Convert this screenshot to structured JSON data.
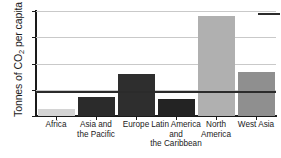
{
  "chart_data": {
    "type": "bar",
    "title": "",
    "xlabel": "",
    "ylabel": "Tonnes of CO2 per capita",
    "ylabel_parts": {
      "prefix": "Tonnes of CO",
      "subscript": "2",
      "suffix": " per capita"
    },
    "ylim": [
      0,
      20
    ],
    "yticks": [
      0,
      5,
      10,
      15,
      20
    ],
    "ytick_labels": [
      "0",
      "5",
      "10",
      "15",
      "20"
    ],
    "grid": true,
    "grid_axis": "y",
    "legend_position": "top-right",
    "categories": [
      "Africa",
      "Asia and the Pacific",
      "Europe",
      "Latin America and the Caribbean",
      "North America",
      "West Asia"
    ],
    "category_label_lines": [
      [
        "Africa"
      ],
      [
        "Asia and",
        "the Pacific"
      ],
      [
        "Europe"
      ],
      [
        "Latin America",
        "and",
        "the Caribbean"
      ],
      [
        "North",
        "America"
      ],
      [
        "West Asia"
      ]
    ],
    "values": [
      1.3,
      3.6,
      8.0,
      3.2,
      19.0,
      8.3
    ],
    "bar_colors": [
      "#d4d4d4",
      "#2b2b2b",
      "#2e2e2e",
      "#232323",
      "#b0b0b0",
      "#8f8f8f"
    ],
    "annotations": [
      {
        "type": "hline",
        "value": 4.7,
        "color": "#2b2b2b",
        "label": ""
      }
    ]
  },
  "axis": {
    "y_title_prefix": "Tonnes of CO",
    "y_title_sub": "2",
    "y_title_suffix": " per capita"
  },
  "colors": {
    "axis": "#1a1a1a",
    "grid": "#c9c9c9",
    "reference_line": "#2b2b2b",
    "background": "#ffffff"
  }
}
